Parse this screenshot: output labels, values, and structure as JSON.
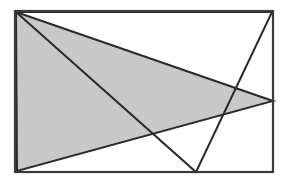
{
  "figure": {
    "title": "Two overlapping triangles inscribed in a rectangle",
    "canvas": {
      "width": 286,
      "height": 183,
      "background": "#ffffff"
    },
    "colors": {
      "background": "#ffffff",
      "frame_stroke": "#3a3a3a",
      "line_stroke": "#2b2b2b",
      "shaded_fill": "#c8c8c8",
      "shaded_stroke": "#2b2b2b",
      "unshaded_fill": "#ffffff"
    },
    "frame": {
      "label": "rectangle-border",
      "x": 15,
      "y": 11,
      "width": 258,
      "height": 161,
      "stroke_width": 2.2
    },
    "points": {
      "top_left": {
        "name": "A",
        "x": 16,
        "y": 12
      },
      "top_right": {
        "name": "B",
        "x": 272,
        "y": 12
      },
      "bottom_right": {
        "name": "C",
        "x": 272,
        "y": 171
      },
      "bottom_left": {
        "name": "D",
        "x": 17,
        "y": 171
      },
      "right_middle": {
        "name": "E",
        "x": 273,
        "y": 101
      },
      "bottom_apex": {
        "name": "F",
        "x": 196,
        "y": 172
      }
    },
    "shapes": [
      {
        "name": "shaded-triangle",
        "kind": "triangle",
        "filled": true,
        "fill": "#c8c8c8",
        "stroke": "#2b2b2b",
        "stroke_width": 2.0,
        "vertices": [
          [
            16,
            12
          ],
          [
            273,
            101
          ],
          [
            17,
            171
          ]
        ],
        "vertex_names": [
          "top_left",
          "right_middle",
          "bottom_left"
        ]
      },
      {
        "name": "unshaded-triangle",
        "kind": "triangle",
        "filled": false,
        "fill": "none",
        "stroke": "#2b2b2b",
        "stroke_width": 2.0,
        "vertices": [
          [
            16,
            12
          ],
          [
            196,
            172
          ],
          [
            272,
            12
          ]
        ],
        "vertex_names": [
          "top_left",
          "bottom_apex",
          "top_right"
        ]
      }
    ],
    "intersections": [
      {
        "name": "crossing-left",
        "x": 152,
        "y": 136
      },
      {
        "name": "crossing-right",
        "x": 224,
        "y": 126
      }
    ]
  }
}
